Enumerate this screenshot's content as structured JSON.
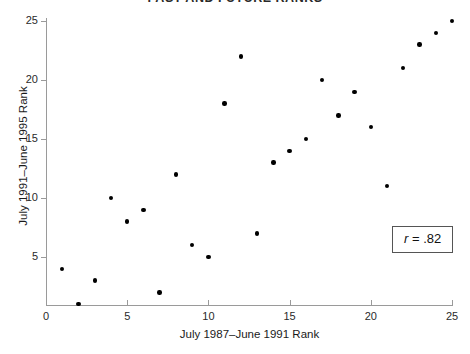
{
  "chart_data": {
    "type": "scatter",
    "title": "PAST AND FUTURE RANKS",
    "xlabel": "July 1987–June 1991 Rank",
    "ylabel": "July 1991–June 1995 Rank",
    "xlim": [
      0,
      25
    ],
    "ylim": [
      0,
      25.8
    ],
    "grid": false,
    "legend": null,
    "xticks": [
      0,
      5,
      10,
      15,
      20,
      25
    ],
    "xtick_labels": [
      "0",
      "5",
      "10",
      "15",
      "20",
      "25"
    ],
    "yticks": [
      5,
      10,
      15,
      20,
      25
    ],
    "ytick_labels": [
      "5",
      "10",
      "15",
      "20",
      "25"
    ],
    "series": [
      {
        "name": "ranks",
        "marker": "filled-circle",
        "color": "#000000",
        "x": [
          1,
          2,
          3,
          4,
          5,
          6,
          7,
          8,
          9,
          10,
          11,
          12,
          13,
          14,
          15,
          16,
          17,
          18,
          19,
          20,
          21,
          22,
          23,
          24,
          25
        ],
        "y": [
          4,
          1,
          3,
          10,
          8,
          9,
          2,
          12,
          6,
          5,
          18,
          22,
          7,
          13,
          14,
          15,
          20,
          17,
          19,
          16,
          11,
          21,
          23,
          24,
          25
        ]
      }
    ],
    "annotations": [
      {
        "name": "correlation-box",
        "symbol": "r",
        "equals": " = ",
        "value": ".82",
        "text": "r = .82",
        "boxed": true
      }
    ]
  }
}
